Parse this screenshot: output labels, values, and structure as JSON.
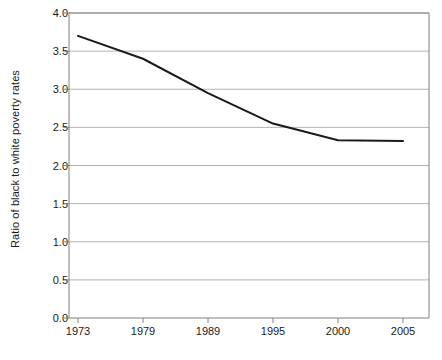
{
  "chart_data": {
    "type": "line",
    "title": "",
    "xlabel": "",
    "ylabel": "Ratio of black to white poverty rates",
    "categories": [
      "1973",
      "1979",
      "1989",
      "1995",
      "2000",
      "2005"
    ],
    "values": [
      3.7,
      3.4,
      2.95,
      2.55,
      2.33,
      2.32
    ],
    "series": [
      {
        "name": "Ratio of black to white poverty rates",
        "values": [
          3.7,
          3.4,
          2.95,
          2.55,
          2.33,
          2.32
        ]
      }
    ],
    "ylim": [
      0.0,
      4.0
    ],
    "yticks": [
      "0.0",
      "0.5",
      "1.0",
      "1.5",
      "2.0",
      "2.5",
      "3.0",
      "3.5",
      "4.0"
    ],
    "ytick_values": [
      0.0,
      0.5,
      1.0,
      1.5,
      2.0,
      2.5,
      3.0,
      3.5,
      4.0
    ],
    "grid": true,
    "grid_axis": "y",
    "legend": "none",
    "line_color": "#1a1a1a",
    "grid_color": "#b3b3b3",
    "axis_color": "#808080",
    "background_color": "#ffffff"
  }
}
